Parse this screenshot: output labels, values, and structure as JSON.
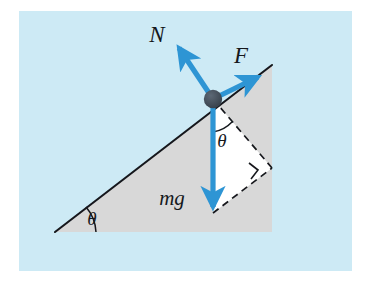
{
  "figure": {
    "name": "inclined-plane-free-body-diagram",
    "panel": {
      "background_color": "#cdeaf5",
      "outer_background_color": "#ffffff",
      "x": 19,
      "y": 11,
      "width": 333,
      "height": 260
    },
    "colors": {
      "arrow_blue": "#2e95d4",
      "arrow_blue_light": "#55aee0",
      "incline_fill": "#d8d8d8",
      "decomposition_fill": "#ffffff",
      "line_black": "#15181c",
      "dot_color": "#3d4752"
    },
    "geometry": {
      "incline_apex": {
        "x": 272,
        "y": 65
      },
      "incline_base_left": {
        "x": 55,
        "y": 232
      },
      "incline_base_right": {
        "x": 272,
        "y": 232
      },
      "ground_line_left": {
        "x": 46,
        "y": 233
      },
      "ground_line_right": {
        "x": 330,
        "y": 233
      },
      "block_dot": {
        "x": 213,
        "y": 99,
        "radius": 9
      },
      "mg_tip": {
        "x": 213,
        "y": 213
      },
      "normal_tip": {
        "x": 175,
        "y": 44
      },
      "applied_force_tip": {
        "x": 263,
        "y": 73
      },
      "right_angle_mark": {
        "x": 255,
        "y": 172
      }
    },
    "labels": [
      {
        "id": "normal-force",
        "text": "N",
        "x": 157,
        "y": 40,
        "kind": "vector-label"
      },
      {
        "id": "applied-force",
        "text": "F",
        "x": 239,
        "y": 63,
        "kind": "vector-label"
      },
      {
        "id": "weight",
        "text": "mg",
        "x": 172,
        "y": 204,
        "kind": "vector-label"
      },
      {
        "id": "incline-angle",
        "text": "θ",
        "x": 92,
        "y": 224,
        "kind": "angle-label"
      },
      {
        "id": "weight-angle",
        "text": "θ",
        "x": 220,
        "y": 145,
        "kind": "angle-label"
      }
    ],
    "vectors": [
      {
        "id": "normal-force-arrow",
        "label": "N",
        "from": "block",
        "direction": "perpendicular-to-incline-outward"
      },
      {
        "id": "applied-force-arrow",
        "label": "F",
        "from": "block",
        "direction": "up-the-incline"
      },
      {
        "id": "weight-arrow",
        "label": "mg",
        "from": "block",
        "direction": "straight-down"
      }
    ],
    "annotations": {
      "right_angle_symbol": "∟",
      "dashed_components": "weight decomposed into components parallel and perpendicular to the incline surface"
    }
  }
}
